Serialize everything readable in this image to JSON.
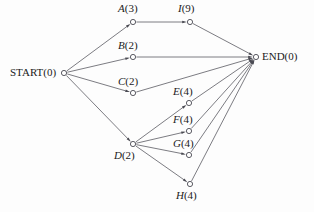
{
  "diagram": {
    "colors": {
      "edge": "#5a5a62",
      "node_stroke": "#4a4a52",
      "node_fill": "#ffffff",
      "text": "#1b1b1b",
      "background": "#fdfdfd"
    },
    "nodes": [
      {
        "id": "START",
        "letter": "START",
        "duration": "(0)",
        "label": "START(0)",
        "italic": false,
        "x": 64,
        "y": 73,
        "label_x": 10,
        "label_y": 67,
        "label_align": "left"
      },
      {
        "id": "A",
        "letter": "A",
        "duration": "(3)",
        "label": "A(3)",
        "italic": true,
        "x": 133,
        "y": 22,
        "label_x": 118,
        "label_y": 3,
        "label_align": "left"
      },
      {
        "id": "I",
        "letter": "I",
        "duration": "(9)",
        "label": "I(9)",
        "italic": true,
        "x": 190,
        "y": 22,
        "label_x": 178,
        "label_y": 3,
        "label_align": "left"
      },
      {
        "id": "B",
        "letter": "B",
        "duration": "(2)",
        "label": "B(2)",
        "italic": true,
        "x": 133,
        "y": 57,
        "label_x": 118,
        "label_y": 40,
        "label_align": "left"
      },
      {
        "id": "C",
        "letter": "C",
        "duration": "(2)",
        "label": "C(2)",
        "italic": true,
        "x": 133,
        "y": 93,
        "label_x": 118,
        "label_y": 76,
        "label_align": "left"
      },
      {
        "id": "D",
        "letter": "D",
        "duration": "(2)",
        "label": "D(2)",
        "italic": true,
        "x": 133,
        "y": 144,
        "label_x": 114,
        "label_y": 150,
        "label_align": "left"
      },
      {
        "id": "E",
        "letter": "E",
        "duration": "(4)",
        "label": "E(4)",
        "italic": true,
        "x": 189,
        "y": 103,
        "label_x": 173,
        "label_y": 86,
        "label_align": "left"
      },
      {
        "id": "F",
        "letter": "F",
        "duration": "(4)",
        "label": "F(4)",
        "italic": true,
        "x": 189,
        "y": 131,
        "label_x": 173,
        "label_y": 114,
        "label_align": "left"
      },
      {
        "id": "G",
        "letter": "G",
        "duration": "(4)",
        "label": "G(4)",
        "italic": true,
        "x": 189,
        "y": 155,
        "label_x": 173,
        "label_y": 138,
        "label_align": "left"
      },
      {
        "id": "H",
        "letter": "H",
        "duration": "(4)",
        "label": "H(4)",
        "italic": true,
        "x": 190,
        "y": 184,
        "label_x": 176,
        "label_y": 190,
        "label_align": "left"
      },
      {
        "id": "END",
        "letter": "END",
        "duration": "(0)",
        "label": "END(0)",
        "italic": false,
        "x": 256,
        "y": 57,
        "label_x": 262,
        "label_y": 51,
        "label_align": "left"
      }
    ],
    "edges": [
      {
        "from": "START",
        "to": "A"
      },
      {
        "from": "START",
        "to": "B"
      },
      {
        "from": "START",
        "to": "C"
      },
      {
        "from": "START",
        "to": "D"
      },
      {
        "from": "A",
        "to": "I"
      },
      {
        "from": "I",
        "to": "END"
      },
      {
        "from": "B",
        "to": "END"
      },
      {
        "from": "C",
        "to": "END"
      },
      {
        "from": "D",
        "to": "E"
      },
      {
        "from": "D",
        "to": "F"
      },
      {
        "from": "D",
        "to": "G"
      },
      {
        "from": "D",
        "to": "H"
      },
      {
        "from": "E",
        "to": "END"
      },
      {
        "from": "F",
        "to": "END"
      },
      {
        "from": "G",
        "to": "END"
      },
      {
        "from": "H",
        "to": "END"
      }
    ],
    "node_radius": 2.6
  }
}
